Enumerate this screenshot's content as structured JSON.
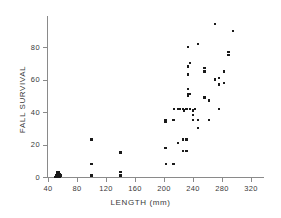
{
  "chart_data": {
    "type": "scatter",
    "title": "",
    "xlabel": "LENGTH (mm)",
    "ylabel": "FALL SURVIVAL",
    "xlim": [
      29,
      340
    ],
    "ylim": [
      -4,
      97
    ],
    "grid": false,
    "legend": null,
    "xticks": [
      40,
      80,
      120,
      160,
      200,
      240,
      280,
      320
    ],
    "yticks": [
      0,
      20,
      40,
      60,
      80
    ],
    "xticklabels": [
      "40",
      "80",
      "120",
      "160",
      "200",
      "240",
      "280",
      "320"
    ],
    "yticklabels": [
      "0",
      "20",
      "40",
      "60",
      "80"
    ],
    "marker": "square",
    "marker_color": "#1a1a1a",
    "points": [
      [
        50,
        0
      ],
      [
        51,
        1
      ],
      [
        52,
        0
      ],
      [
        52,
        2
      ],
      [
        53,
        1
      ],
      [
        53,
        0
      ],
      [
        54,
        2
      ],
      [
        54,
        0
      ],
      [
        55,
        1
      ],
      [
        55,
        3
      ],
      [
        56,
        0
      ],
      [
        56,
        2
      ],
      [
        57,
        1
      ],
      [
        53,
        3
      ],
      [
        100,
        23
      ],
      [
        100,
        8
      ],
      [
        100,
        1
      ],
      [
        140,
        15
      ],
      [
        140,
        3
      ],
      [
        140,
        1
      ],
      [
        202,
        35
      ],
      [
        202,
        34
      ],
      [
        202,
        18
      ],
      [
        203,
        8
      ],
      [
        213,
        35
      ],
      [
        213,
        8
      ],
      [
        219,
        42
      ],
      [
        219,
        21
      ],
      [
        226,
        42
      ],
      [
        226,
        23
      ],
      [
        226,
        16
      ],
      [
        231,
        42
      ],
      [
        231,
        23
      ],
      [
        231,
        16
      ],
      [
        233,
        80
      ],
      [
        233,
        68
      ],
      [
        233,
        63
      ],
      [
        233,
        54
      ],
      [
        233,
        51
      ],
      [
        233,
        50
      ],
      [
        236,
        70
      ],
      [
        236,
        51
      ],
      [
        236,
        42
      ],
      [
        240,
        41
      ],
      [
        240,
        38
      ],
      [
        240,
        35
      ],
      [
        243,
        42
      ],
      [
        247,
        82
      ],
      [
        247,
        35
      ],
      [
        247,
        30
      ],
      [
        256,
        67
      ],
      [
        256,
        65
      ],
      [
        256,
        49
      ],
      [
        262,
        47
      ],
      [
        262,
        35
      ],
      [
        270,
        94
      ],
      [
        270,
        60
      ],
      [
        276,
        57
      ],
      [
        276,
        61
      ],
      [
        276,
        42
      ],
      [
        283,
        65
      ],
      [
        283,
        58
      ],
      [
        289,
        75
      ],
      [
        289,
        77
      ],
      [
        295,
        90
      ],
      [
        214,
        42
      ],
      [
        222,
        42
      ],
      [
        228,
        41
      ]
    ]
  }
}
